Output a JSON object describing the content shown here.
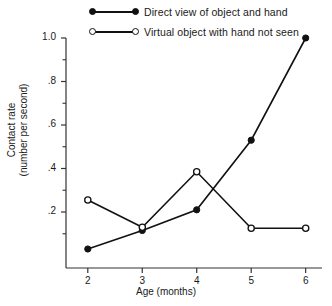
{
  "chart_data": {
    "type": "line",
    "title": "",
    "xlabel": "Age (months)",
    "ylabel": "Contact rate\n(number per second)",
    "x": [
      2,
      3,
      4,
      5,
      6
    ],
    "xtick_labels": [
      "2",
      "3",
      "4",
      "5",
      "6"
    ],
    "ytick_labels": [
      "1.0",
      ".8",
      ".6",
      ".4",
      ".2"
    ],
    "ytick_values": [
      1.0,
      0.8,
      0.6,
      0.4,
      0.2
    ],
    "yminor_values": [
      0.9,
      0.7,
      0.5,
      0.3,
      0.1
    ],
    "xlim": [
      1.6,
      6.3
    ],
    "ylim": [
      0.0,
      1.05
    ],
    "grid": false,
    "legend_position": "top",
    "series": [
      {
        "name": "Direct view of object and hand",
        "marker": "filled-circle",
        "values": [
          0.03,
          0.115,
          0.21,
          0.53,
          1.0
        ]
      },
      {
        "name": "Virtual object with hand not seen",
        "marker": "open-circle",
        "values": [
          0.255,
          0.13,
          0.385,
          0.125,
          0.125
        ]
      }
    ]
  },
  "legend": {
    "items": [
      {
        "label": "Direct view of object and hand",
        "marker": "filled-circle"
      },
      {
        "label": "Virtual object with hand not seen",
        "marker": "open-circle"
      }
    ]
  },
  "axes": {
    "x_title": "Age (months)",
    "y_title_line1": "Contact rate",
    "y_title_line2": "(number per second)",
    "x_ticks": [
      "2",
      "3",
      "4",
      "5",
      "6"
    ],
    "y_ticks": [
      "1.0",
      ".8",
      ".6",
      ".4",
      ".2"
    ]
  },
  "colors": {
    "line": "#111111",
    "axis": "#333333",
    "background": "#ffffff"
  }
}
